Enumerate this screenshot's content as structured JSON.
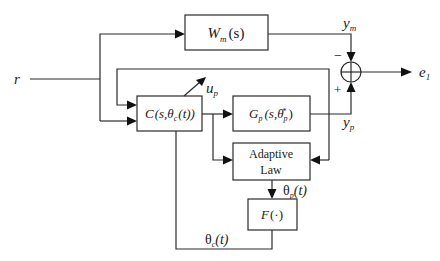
{
  "diagram": {
    "type": "block-diagram",
    "signals": {
      "reference": "r",
      "model_output": "y",
      "model_output_sub": "m",
      "control": "u",
      "control_sub": "p",
      "plant_output": "y",
      "plant_output_sub": "p",
      "error": "e",
      "error_sub": "1",
      "theta_p": "θ",
      "theta_p_sub": "p",
      "theta_p_arg": "(t)",
      "theta_c": "θ",
      "theta_c_sub": "c",
      "theta_c_arg": "(t)"
    },
    "blocks": {
      "reference_model": {
        "main": "W",
        "sub": "m",
        "arg": "(s)"
      },
      "controller": {
        "main": "C",
        "open": "(s,θ",
        "sub": "c",
        "arg": "(t))"
      },
      "plant": {
        "main": "G",
        "sub": "p",
        "open": "(s,θ",
        "sub2": "p",
        "sup": "*",
        "close": ")"
      },
      "adaptive_law": {
        "line1": "Adaptive",
        "line2": "Law"
      },
      "mapping": {
        "main": "F",
        "arg": "(·)"
      }
    },
    "summing_junction": {
      "minus_sign": "−",
      "plus_sign": "+"
    }
  }
}
